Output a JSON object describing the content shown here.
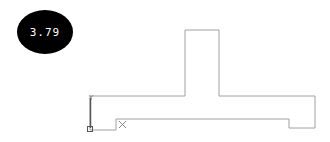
{
  "badge": {
    "value": "3.79"
  },
  "drawing": {
    "outline_color": "#a0a0a0",
    "axis_color": "#555555",
    "outline_points": "90,96 185,96 185,30 219,30 219,96 315,96 315,128 289,128 289,119 116,119 116,130 90,130 90,96",
    "axis_label": "Y",
    "cross_marker": "X"
  }
}
